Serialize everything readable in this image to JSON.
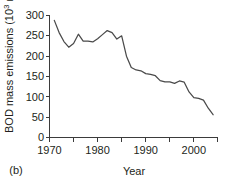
{
  "panel": {
    "label": "(b)"
  },
  "chart_data": {
    "type": "line",
    "title": "",
    "xlabel": "Year",
    "ylabel_prefix": "BOD mass emissions (10",
    "ylabel_exponent": "3",
    "ylabel_suffix": " mt)",
    "ylabel_full": "BOD mass emissions (10^3 mt)",
    "xlim": [
      1970,
      2005
    ],
    "ylim": [
      0,
      300
    ],
    "xticks_major": [
      1970,
      1980,
      1990,
      2000
    ],
    "xticklabels_major": [
      "1970",
      "1980",
      "1990",
      "2000"
    ],
    "xticks_minor": [
      1975,
      1985,
      1995,
      2005
    ],
    "yticks": [
      0,
      50,
      100,
      150,
      200,
      250,
      300
    ],
    "yticklabels": [
      "0",
      "50",
      "100",
      "150",
      "200",
      "250",
      "300"
    ],
    "grid": false,
    "legend": false,
    "series": [
      {
        "name": "BOD mass emissions",
        "x": [
          1971,
          1972,
          1973,
          1974,
          1975,
          1976,
          1977,
          1978,
          1979,
          1980,
          1981,
          1982,
          1983,
          1984,
          1985,
          1986,
          1987,
          1988,
          1989,
          1990,
          1991,
          1992,
          1993,
          1994,
          1995,
          1996,
          1997,
          1998,
          1999,
          2000,
          2001,
          2002,
          2003,
          2004
        ],
        "values": [
          288,
          258,
          236,
          222,
          231,
          254,
          237,
          237,
          235,
          243,
          253,
          263,
          258,
          242,
          250,
          200,
          172,
          166,
          164,
          157,
          155,
          152,
          140,
          137,
          137,
          133,
          139,
          136,
          112,
          98,
          96,
          92,
          72,
          56
        ]
      }
    ]
  }
}
